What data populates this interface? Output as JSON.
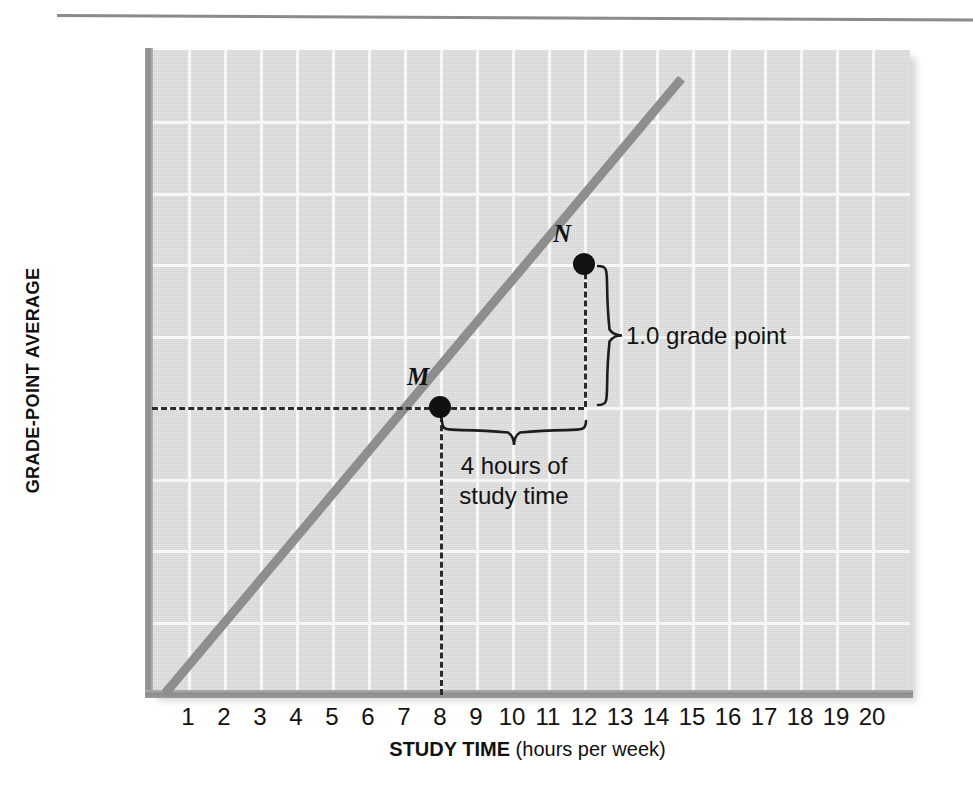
{
  "chart_data": {
    "type": "line",
    "title": "",
    "xlabel_strong": "STUDY TIME",
    "xlabel_rest": " (hours per week)",
    "ylabel": "GRADE-POINT AVERAGE",
    "xlim": [
      0,
      20.2
    ],
    "ylim": [
      0,
      4.5
    ],
    "grid": true,
    "legend": "none",
    "x_ticks": [
      "1",
      "2",
      "3",
      "4",
      "5",
      "6",
      "7",
      "8",
      "9",
      "10",
      "11",
      "12",
      "13",
      "14",
      "15",
      "16",
      "17",
      "18",
      "19",
      "20"
    ],
    "x_tick_values": [
      1,
      2,
      3,
      4,
      5,
      6,
      7,
      8,
      9,
      10,
      11,
      12,
      13,
      14,
      15,
      16,
      17,
      18,
      19,
      20
    ],
    "y_ticks": [
      {
        "value": 4.0,
        "label": "4.0",
        "sub": "(= A)"
      },
      {
        "value": 3.5,
        "label": "3.5",
        "sub": ""
      },
      {
        "value": 3.0,
        "label": "3.0",
        "sub": "(= B)"
      },
      {
        "value": 2.5,
        "label": "2.5",
        "sub": ""
      },
      {
        "value": 2.0,
        "label": "2.0",
        "sub": "(= C)"
      },
      {
        "value": 1.5,
        "label": "1.5",
        "sub": ""
      },
      {
        "value": 1.0,
        "label": "1.0",
        "sub": "(= D)"
      },
      {
        "value": 0.5,
        "label": "0.5",
        "sub": ""
      },
      {
        "value": 0.0,
        "label": "0",
        "sub": "(= F)"
      }
    ],
    "series": [
      {
        "name": "study-time vs GPA",
        "color": "#8e8e8e",
        "x": [
          0.35,
          14.7
        ],
        "y": [
          0.0,
          4.3
        ],
        "slope_grade_points_per_hour": 0.25
      }
    ],
    "points": [
      {
        "label": "M",
        "x": 8,
        "y": 2.0
      },
      {
        "label": "N",
        "x": 12,
        "y": 3.0
      }
    ],
    "annotations": [
      {
        "name": "rise",
        "text": "1.0 grade point",
        "from_y": 3.0,
        "to_y": 2.0,
        "at_x": 12
      },
      {
        "name": "run",
        "text_line1": "4 hours of",
        "text_line2": "study time",
        "from_x": 8,
        "to_x": 12,
        "at_y": 2.0
      }
    ],
    "colors": {
      "plot_background": "#dcdcdc",
      "gridline": "#fbfbfb",
      "axis_bar": "#8d8d8d",
      "line": "#8e8e8e",
      "point": "#111111",
      "dashed": "#2b2b2b",
      "page": "#ffffff"
    }
  },
  "axes": {
    "y_title": "GRADE-POINT AVERAGE",
    "x_title_strong": "STUDY TIME",
    "x_title_rest": " (hours per week)"
  },
  "annotations": {
    "rise_label": "1.0 grade point",
    "run_label_line1": "4 hours of",
    "run_label_line2": "study time",
    "point_m": "M",
    "point_n": "N"
  }
}
